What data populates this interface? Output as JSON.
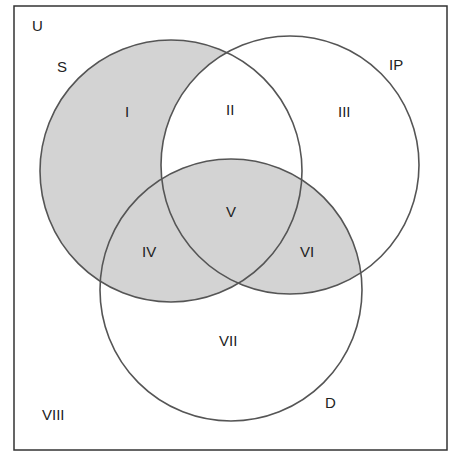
{
  "diagram": {
    "type": "venn",
    "universe_label": "U",
    "sets": [
      {
        "id": "S",
        "label": "S"
      },
      {
        "id": "IP",
        "label": "IP"
      },
      {
        "id": "D",
        "label": "D"
      }
    ],
    "regions": [
      {
        "id": "I",
        "label": "I",
        "shaded": true
      },
      {
        "id": "II",
        "label": "II",
        "shaded": true
      },
      {
        "id": "III",
        "label": "III",
        "shaded": false
      },
      {
        "id": "IV",
        "label": "IV",
        "shaded": true
      },
      {
        "id": "V",
        "label": "V",
        "shaded": true
      },
      {
        "id": "VI",
        "label": "VI",
        "shaded": true
      },
      {
        "id": "VII",
        "label": "VII",
        "shaded": false
      },
      {
        "id": "VIII",
        "label": "VIII",
        "shaded": false
      }
    ],
    "colors": {
      "shade": "#d3d3d3",
      "stroke": "#555555",
      "background": "#ffffff"
    }
  }
}
